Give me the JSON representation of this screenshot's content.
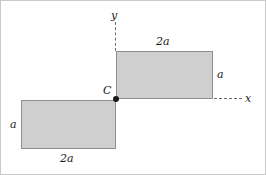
{
  "figure": {
    "point_label": "C",
    "axes": {
      "y_label": "y",
      "x_label": "x",
      "y_line_style": "dashed",
      "x_line_style": "dashed"
    },
    "colors": {
      "fill": "#cfcfcf",
      "stroke": "#8f8f8f",
      "axis": "#6d6d6d",
      "text": "#1a1a1a",
      "background": "#ffffff",
      "border": "#c9c9c9"
    },
    "shapes": [
      {
        "name": "upper-right-rectangle",
        "width_label": "2a",
        "height_label": "a",
        "width_label_position": "top",
        "height_label_position": "right"
      },
      {
        "name": "lower-left-rectangle",
        "width_label": "2a",
        "height_label": "a",
        "width_label_position": "bottom",
        "height_label_position": "left"
      }
    ],
    "labels": {
      "top_width": "2a",
      "top_height": "a",
      "bottom_width": "2a",
      "bottom_height": "a"
    }
  }
}
